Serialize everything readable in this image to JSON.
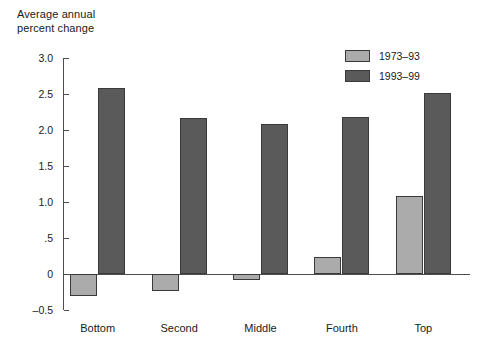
{
  "chart_data": {
    "type": "bar",
    "title": "",
    "subtitle": "",
    "ylabel": "Average annual\npercent change",
    "xlabel": "",
    "categories": [
      "Bottom",
      "Second",
      "Middle",
      "Fourth",
      "Top"
    ],
    "series": [
      {
        "name": "1973–93",
        "color": "#ababab",
        "values": [
          -0.3,
          -0.23,
          -0.08,
          0.23,
          1.09
        ]
      },
      {
        "name": "1993–99",
        "color": "#5a5a5a",
        "values": [
          2.58,
          2.17,
          2.09,
          2.18,
          2.52
        ]
      }
    ],
    "ylim": [
      -0.5,
      3.0
    ],
    "yticks": [
      3.0,
      2.5,
      2.0,
      1.5,
      1.0,
      0.5,
      0.0,
      -0.5
    ],
    "ytick_labels": [
      "3.0",
      "2.5",
      "2.0",
      "1.5",
      "1.0",
      ".5",
      "0",
      "–0.5"
    ],
    "grid": false,
    "legend_position": "top-right",
    "zero_line": true
  },
  "axis_title": "Average annual\npercent change",
  "legend": {
    "items": [
      {
        "label": "1973–93",
        "color": "#ababab"
      },
      {
        "label": "1993–99",
        "color": "#5a5a5a"
      }
    ]
  },
  "colors": {
    "series_light": "#ababab",
    "series_dark": "#5a5a5a",
    "axis": "#4d4d4d",
    "bar_border": "#3a3a3a",
    "text": "#1a1a1a",
    "background": "#ffffff"
  }
}
